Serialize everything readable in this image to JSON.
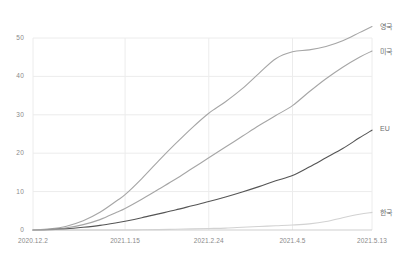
{
  "chart_data": {
    "type": "line",
    "title": "",
    "subtitle": "",
    "xlabel": "",
    "ylabel": "",
    "grid": true,
    "legend_position": "right-inline",
    "xlim": [
      0,
      162
    ],
    "ylim": [
      0,
      55
    ],
    "y_ticks": [
      0,
      10,
      20,
      30,
      40,
      50
    ],
    "x_tick_labels": [
      "2020.12.2",
      "2021.1.15",
      "2021.2.24",
      "2021.4.5",
      "2021.5.13"
    ],
    "x_tick_positions": [
      0,
      44,
      84,
      124,
      162
    ],
    "series": [
      {
        "name": "영국",
        "color": "#a6a6a6",
        "x": [
          0,
          8,
          16,
          24,
          32,
          40,
          44,
          52,
          60,
          68,
          76,
          84,
          92,
          100,
          108,
          116,
          124,
          132,
          140,
          148,
          156,
          162
        ],
        "values": [
          0.0,
          0.3,
          1.0,
          2.4,
          4.6,
          7.6,
          9.2,
          13.4,
          18.0,
          22.4,
          26.6,
          30.4,
          33.4,
          36.8,
          40.8,
          44.6,
          46.4,
          46.9,
          47.8,
          49.3,
          51.4,
          53.0
        ]
      },
      {
        "name": "미국",
        "color": "#a6a6a6",
        "x": [
          0,
          8,
          16,
          24,
          32,
          40,
          44,
          52,
          60,
          68,
          76,
          84,
          92,
          100,
          108,
          116,
          124,
          132,
          140,
          148,
          156,
          162
        ],
        "values": [
          0.0,
          0.2,
          0.6,
          1.4,
          2.7,
          4.6,
          5.6,
          8.0,
          10.6,
          13.2,
          16.0,
          18.8,
          21.6,
          24.4,
          27.2,
          29.8,
          32.4,
          36.0,
          39.4,
          42.4,
          45.0,
          46.6
        ]
      },
      {
        "name": "EU",
        "color": "#555555",
        "x": [
          0,
          8,
          16,
          24,
          32,
          40,
          44,
          52,
          60,
          68,
          76,
          84,
          92,
          100,
          108,
          116,
          124,
          132,
          140,
          148,
          156,
          162
        ],
        "values": [
          0.0,
          0.1,
          0.3,
          0.7,
          1.2,
          1.9,
          2.3,
          3.2,
          4.2,
          5.2,
          6.3,
          7.4,
          8.6,
          9.9,
          11.3,
          12.8,
          14.2,
          16.4,
          18.8,
          21.2,
          24.0,
          26.0
        ]
      },
      {
        "name": "한국",
        "color": "#d2d2d2",
        "x": [
          0,
          8,
          16,
          24,
          32,
          40,
          44,
          52,
          60,
          68,
          76,
          84,
          92,
          100,
          108,
          116,
          124,
          132,
          140,
          148,
          156,
          162
        ],
        "values": [
          0.0,
          0.0,
          0.0,
          0.0,
          0.0,
          0.0,
          0.0,
          0.05,
          0.1,
          0.2,
          0.3,
          0.4,
          0.5,
          0.7,
          0.9,
          1.1,
          1.3,
          1.6,
          2.2,
          3.2,
          4.1,
          4.6
        ]
      }
    ]
  },
  "axis": {
    "y_tick_labels": [
      "0",
      "10",
      "20",
      "30",
      "40",
      "50"
    ],
    "x_tick_labels": [
      "2020.12.2",
      "2021.1.15",
      "2021.2.24",
      "2021.4.5",
      "2021.5.13"
    ]
  },
  "legend": {
    "items": [
      {
        "label": "영국"
      },
      {
        "label": "미국"
      },
      {
        "label": "EU"
      },
      {
        "label": "한국"
      }
    ]
  },
  "colors": {
    "grid": "#ececec",
    "axis": "#cfcfcf",
    "tick_text": "#8a8a8a",
    "legend_text": "#6e6e6e",
    "background": "#ffffff"
  }
}
